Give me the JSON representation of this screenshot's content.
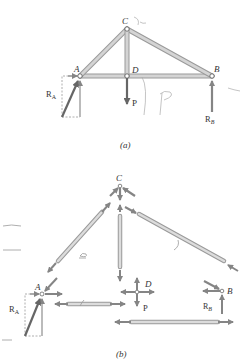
{
  "figure_a": {
    "caption": "(a)",
    "joints": {
      "A": "A",
      "B": "B",
      "C": "C",
      "D": "D"
    },
    "loads": {
      "P": "P",
      "RA": "R",
      "RA_sub": "A",
      "RB": "R",
      "RB_sub": "B"
    },
    "handwriting": [
      "Y2",
      "P"
    ]
  },
  "figure_b": {
    "caption": "(b)",
    "joints": {
      "A": "A",
      "B": "B",
      "C": "C",
      "D": "D"
    },
    "loads": {
      "P": "P",
      "RA": "R",
      "RA_sub": "A",
      "RB": "R",
      "RB_sub": "B"
    }
  },
  "colors": {
    "member": "#c8c8c8",
    "member_edge": "#9a9a9a",
    "arrow": "#8a8a8a",
    "dark_arrow": "#6a6a6a",
    "text": "#333333",
    "pencil": "#9a9a9a"
  }
}
